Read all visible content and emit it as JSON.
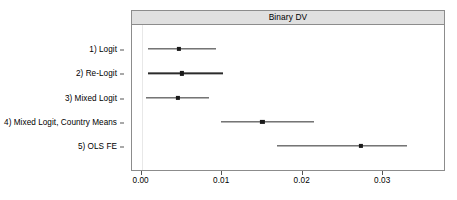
{
  "chart_data": {
    "type": "scatter",
    "subtype": "dot-and-whisker coefficient plot",
    "title": "Binary DV",
    "xlabel": "",
    "ylabel": "",
    "xlim": [
      -0.0012,
      0.0378
    ],
    "xticks": [
      0.0,
      0.01,
      0.02,
      0.03
    ],
    "xticklabels": [
      "0.00",
      "0.01",
      "0.02",
      "0.03"
    ],
    "grid": false,
    "legend": null,
    "orientation": "horizontal",
    "categories": [
      "1) Logit",
      "2) Re-Logit",
      "3) Mixed Logit",
      "4) Mixed Logit, Country Means",
      "5) OLS FE"
    ],
    "points": [
      {
        "label": "1) Logit",
        "estimate": 0.0046,
        "ci_low": 0.0008,
        "ci_high": 0.0092
      },
      {
        "label": "2) Re-Logit",
        "estimate": 0.005,
        "ci_low": 0.0008,
        "ci_high": 0.0101
      },
      {
        "label": "3) Mixed Logit",
        "estimate": 0.0045,
        "ci_low": 0.0005,
        "ci_high": 0.0084
      },
      {
        "label": "4) Mixed Logit, Country Means",
        "estimate": 0.015,
        "ci_low": 0.0098,
        "ci_high": 0.0214
      },
      {
        "label": "5) OLS FE",
        "estimate": 0.0272,
        "ci_low": 0.0168,
        "ci_high": 0.033
      }
    ],
    "colors": {
      "point": "#1a1a1a",
      "whisker": "#2b2b2b",
      "strip_background": "#e0e0e0",
      "panel_border": "#8c8c8c",
      "background": "#ffffff"
    }
  },
  "panel": {
    "strip_title": "Binary DV"
  }
}
